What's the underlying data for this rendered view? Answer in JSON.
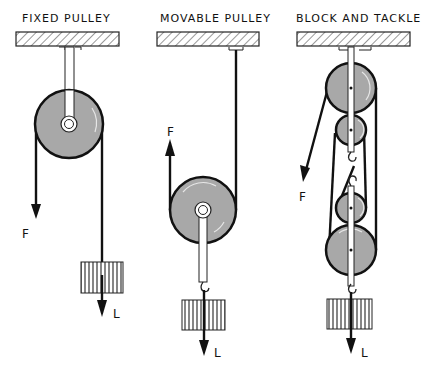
{
  "diagram": {
    "panels": [
      {
        "title": "FIXED PULLEY",
        "force_label": "F",
        "load_label": "L"
      },
      {
        "title": "MOVABLE PULLEY",
        "force_label": "F",
        "load_label": "L"
      },
      {
        "title": "BLOCK AND TACKLE",
        "force_label": "F",
        "load_label": "L"
      }
    ],
    "colors": {
      "wheel": "#a8a8a8",
      "line": "#111111",
      "background": "#ffffff"
    }
  }
}
